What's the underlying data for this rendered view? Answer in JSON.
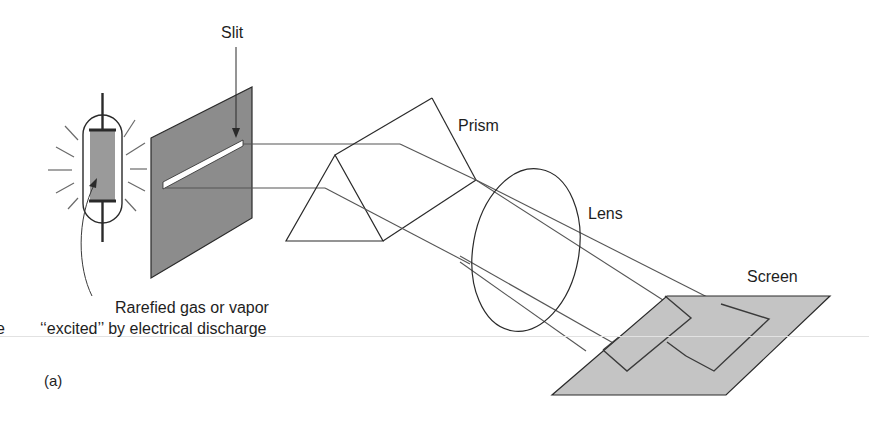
{
  "diagram": {
    "type": "spectroscope-schematic",
    "panel_label": "(a)",
    "colors": {
      "stroke": "#2a2a2a",
      "slit_screen_fill": "#8c8c8c",
      "lamp_fill": "#9a9a9a",
      "viewing_screen_fill": "#c4c4c4",
      "ray": "#555555"
    },
    "labels": {
      "slit": "Slit",
      "prism": "Prism",
      "lens": "Lens",
      "screen": "Screen",
      "source_line1": "Rarefied gas or vapor",
      "source_line2": "‘‘excited’’ by electrical discharge",
      "edge_fragment": "e"
    },
    "components": [
      {
        "name": "gas discharge tube",
        "role": "light source"
      },
      {
        "name": "slit",
        "role": "aperture"
      },
      {
        "name": "prism",
        "role": "disperser"
      },
      {
        "name": "lens",
        "role": "focusing"
      },
      {
        "name": "screen",
        "role": "display of spectral lines"
      }
    ]
  }
}
